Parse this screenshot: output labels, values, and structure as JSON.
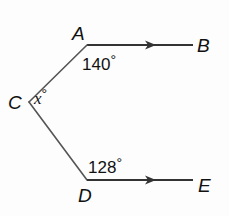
{
  "diagram": {
    "type": "geometry-parallel-lines",
    "points": {
      "A": {
        "label": "A"
      },
      "B": {
        "label": "B"
      },
      "C": {
        "label": "C"
      },
      "D": {
        "label": "D"
      },
      "E": {
        "label": "E"
      }
    },
    "angles": {
      "at_A": {
        "value": "140",
        "unit": "°"
      },
      "at_C": {
        "value": "x",
        "unit": "°"
      },
      "at_D": {
        "value": "128",
        "unit": "°"
      }
    },
    "segments": [
      "AB",
      "CA",
      "CD",
      "DE"
    ],
    "parallel_marks": [
      "AB",
      "DE"
    ],
    "colors": {
      "line": "#555555",
      "text": "#111111",
      "background": "#fdfdfd"
    }
  }
}
